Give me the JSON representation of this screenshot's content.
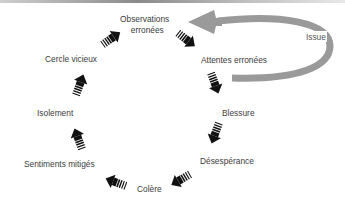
{
  "diagram": {
    "type": "cycle",
    "title": "",
    "nodes": [
      {
        "id": "observations",
        "label_line1": "Observations",
        "label_line2": "erronées"
      },
      {
        "id": "attentes",
        "label": "Attentes erronées"
      },
      {
        "id": "blessure",
        "label": "Blessure"
      },
      {
        "id": "desesperance",
        "label": "Désespérance"
      },
      {
        "id": "colere",
        "label": "Colère"
      },
      {
        "id": "sentiments",
        "label": "Sentiments mitigés"
      },
      {
        "id": "isolement",
        "label": "Isolement"
      },
      {
        "id": "cercle",
        "label": "Cercle vicieux"
      }
    ],
    "edges": [
      {
        "from": "observations",
        "to": "attentes"
      },
      {
        "from": "attentes",
        "to": "blessure"
      },
      {
        "from": "blessure",
        "to": "desesperance"
      },
      {
        "from": "desesperance",
        "to": "colere"
      },
      {
        "from": "colere",
        "to": "sentiments"
      },
      {
        "from": "sentiments",
        "to": "isolement"
      },
      {
        "from": "isolement",
        "to": "cercle"
      },
      {
        "from": "cercle",
        "to": "observations"
      }
    ],
    "exit_loop": {
      "label": "Issue",
      "from": "attentes",
      "to": "observations"
    },
    "colors": {
      "arrow": "#111111",
      "exit_loop": "#9a9a9a",
      "text": "#3c3c3c"
    }
  }
}
